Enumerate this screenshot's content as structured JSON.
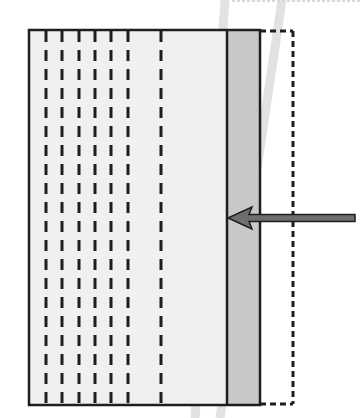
{
  "diagram": {
    "colors": {
      "background": "#ffffff",
      "panel_fill": "#f0f0f0",
      "strip_fill": "#c8c8c8",
      "stroke": "#1e1e1e",
      "arrow_fill": "#6e6e6e",
      "ghost_band": "#e2e2e2"
    },
    "frame": {
      "x": 29,
      "y": 30,
      "width": 231,
      "height": 375
    },
    "gray_strip": {
      "x": 227,
      "width": 33
    },
    "dashed_outline": {
      "x_right": 293
    },
    "dash_columns_x": [
      46,
      62,
      79,
      95,
      111,
      128,
      161
    ],
    "dash": {
      "width": 3,
      "height": 11,
      "period": 19
    },
    "arrow": {
      "x_start": 355,
      "x_end": 228,
      "y": 218,
      "direction": "left"
    },
    "ghost_bands": [
      {
        "x_top": 225,
        "x_bottom": 195
      },
      {
        "x_top": 282,
        "x_bottom": 220
      }
    ]
  }
}
